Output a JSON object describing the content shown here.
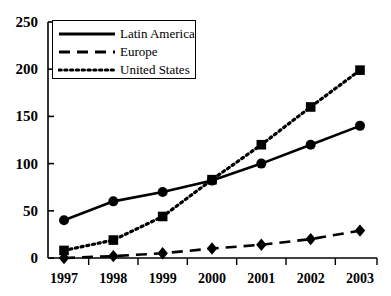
{
  "chart_data": {
    "type": "line",
    "title": "",
    "xlabel": "",
    "ylabel": "",
    "categories": [
      "1997",
      "1998",
      "1999",
      "2000",
      "2001",
      "2002",
      "2003"
    ],
    "x": [
      1997,
      1998,
      1999,
      2000,
      2001,
      2002,
      2003
    ],
    "ylim": [
      0,
      250
    ],
    "xlim": [
      1996.6,
      2003.4
    ],
    "yticks": [
      0,
      50,
      100,
      150,
      200,
      250
    ],
    "grid": false,
    "legend_position": "upper-left",
    "series": [
      {
        "name": "Latin America",
        "values": [
          40,
          60,
          70,
          82,
          100,
          120,
          140
        ],
        "marker": "circle",
        "linestyle": "solid",
        "color": "#000000"
      },
      {
        "name": "Europe",
        "values": [
          0,
          2,
          5,
          10,
          14,
          20,
          29
        ],
        "marker": "diamond",
        "linestyle": "dashed",
        "color": "#000000"
      },
      {
        "name": "United States",
        "values": [
          8,
          19,
          44,
          83,
          120,
          160,
          199
        ],
        "marker": "square",
        "linestyle": "dotted",
        "color": "#000000"
      }
    ]
  },
  "axes": {
    "ytick_labels": [
      "250",
      "200",
      "150",
      "100",
      "50",
      "0"
    ],
    "xtick_labels": [
      "1997",
      "1998",
      "1999",
      "2000",
      "2001",
      "2002",
      "2003"
    ]
  },
  "legend": {
    "entries": [
      {
        "label": "Latin America",
        "style": "solid"
      },
      {
        "label": "Europe",
        "style": "dashed"
      },
      {
        "label": "United States",
        "style": "dotted"
      }
    ]
  },
  "colors": {
    "ink": "#000000",
    "background": "#ffffff"
  }
}
